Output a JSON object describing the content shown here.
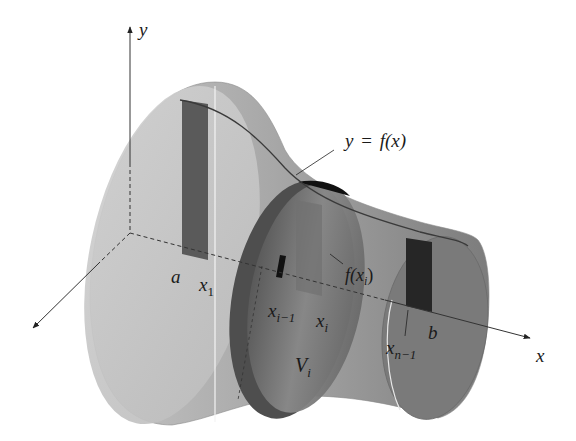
{
  "diagram": {
    "type": "solid-of-revolution-disk-method",
    "axes": {
      "y_label": "y",
      "x_label": "x"
    },
    "curve_label": {
      "lhs": "y",
      "eq": "=",
      "rhs": "f(x)"
    },
    "points": {
      "a": "a",
      "x1_base": "x",
      "x1_sub": "1",
      "xim1_base": "x",
      "xim1_sub": "i−1",
      "xi_base": "x",
      "xi_sub": "i",
      "xnm1_base": "x",
      "xnm1_sub": "n−1",
      "b": "b"
    },
    "height_label": {
      "fn": "f(x",
      "sub": "i",
      "close": ")"
    },
    "volume_label": {
      "base": "V",
      "sub": "i"
    },
    "colors": {
      "solid_light": "#c8c8c8",
      "solid_mid": "#9a9a9a",
      "solid_dark": "#6e6e6e",
      "strip_dark": "#3a3a3a",
      "axis": "#333333"
    }
  }
}
